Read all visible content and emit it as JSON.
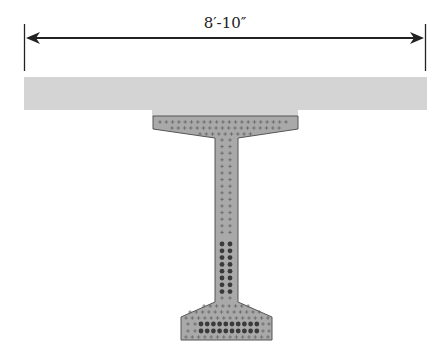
{
  "figure": {
    "type": "bridge girder cross-section",
    "dimension": {
      "label": "8′-10″",
      "description": "deck slab width / girder spacing"
    },
    "components": {
      "deck_slab": {
        "name": "Deck slab",
        "color": "#d4d4d4"
      },
      "girder": {
        "name": "Precast I-girder",
        "color": "#a9a9a9",
        "outline": "#555555"
      },
      "mild_reinforcement_marker": "+",
      "prestressing_strands_marker": "●"
    },
    "strands": {
      "web_rows": 8,
      "web_columns": 2,
      "bottom_flange_rows": 2,
      "bottom_flange_columns": 10
    },
    "colors": {
      "line": "#222222",
      "deck": "#d4d4d4",
      "girder": "#a9a9a9",
      "strand": "#3a3a3a",
      "plus": "#666666"
    }
  }
}
